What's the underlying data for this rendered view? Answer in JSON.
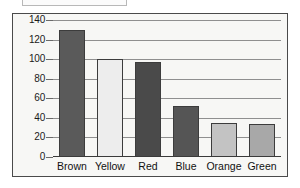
{
  "title_box": {
    "label": ""
  },
  "chart_data": {
    "type": "bar",
    "title": "",
    "subtitle": "",
    "xlabel": "",
    "ylabel": "",
    "categories": [
      "Brown",
      "Yellow",
      "Red",
      "Blue",
      "Orange",
      "Green"
    ],
    "values": [
      130,
      100,
      97,
      52,
      35,
      34
    ],
    "series": [
      {
        "name": "Count",
        "values": [
          130,
          100,
          97,
          52,
          35,
          34
        ]
      }
    ],
    "ylim": [
      0,
      140
    ],
    "ytick_values": [
      0,
      20,
      40,
      60,
      80,
      100,
      120,
      140
    ],
    "ytick_labels": [
      "0",
      "20",
      "40",
      "60",
      "80",
      "100",
      "120",
      "140"
    ],
    "grid": true,
    "grid_axis": "y",
    "legend": false,
    "legend_position": "none",
    "bar_colors": [
      "#5a5a5a",
      "#ededed",
      "#4a4a4a",
      "#555555",
      "#c3c3c3",
      "#a8a8a8"
    ],
    "bar_border_color": "#3c3c3c",
    "plot_background": "#f7f7f5",
    "frame_color": "#4a4a4a",
    "gridline_color": "#8f8f8f",
    "text_color": "#111111"
  }
}
